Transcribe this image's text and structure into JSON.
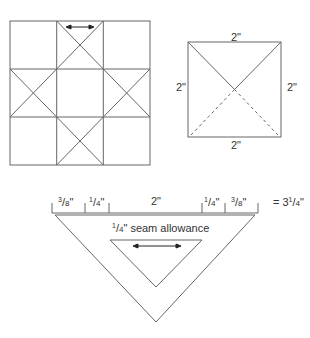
{
  "block_diagram": {
    "description": "Ohio Star style 3x3 quilt block with quarter-square triangles",
    "grain_arrow": "double-headed arrow in top center triangle"
  },
  "unit_square": {
    "top_label": "2\"",
    "bottom_label": "2\"",
    "left_label": "2\"",
    "right_label": "2\""
  },
  "template": {
    "segments": [
      {
        "num": "3",
        "den": "8",
        "unit": "\""
      },
      {
        "num": "1",
        "den": "4",
        "unit": "\""
      },
      {
        "label": "2\""
      },
      {
        "num": "1",
        "den": "4",
        "unit": "\""
      },
      {
        "num": "3",
        "den": "8",
        "unit": "\""
      }
    ],
    "total": {
      "prefix": "= 3",
      "num": "1",
      "den": "4",
      "unit": "\""
    },
    "seam_label": {
      "num": "1",
      "den": "4",
      "text": "\" seam allowance"
    }
  },
  "colors": {
    "line": "#555555",
    "text": "#333333"
  }
}
